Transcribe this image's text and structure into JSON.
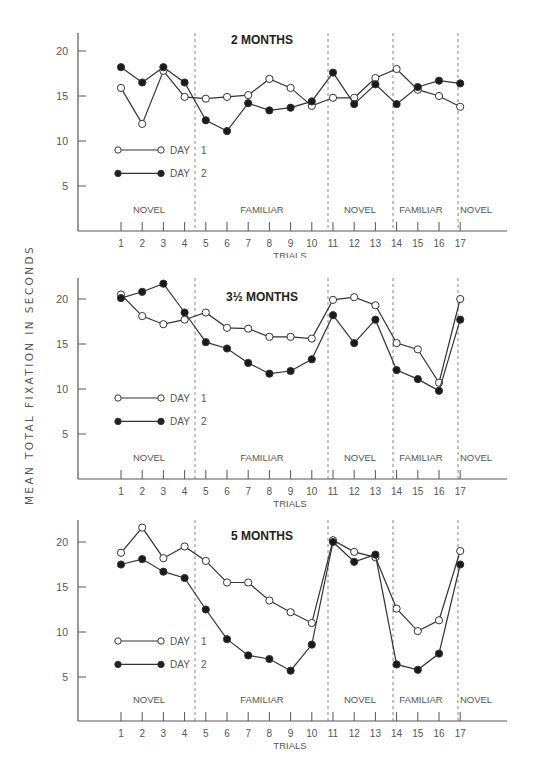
{
  "figure": {
    "y_axis_label": "MEAN TOTAL FIXATION IN SECONDS",
    "x_axis_label": "TRIALS",
    "legend": [
      {
        "label": "DAY",
        "number": "1",
        "marker": "open-circle"
      },
      {
        "label": "DAY",
        "number": "2",
        "marker": "filled-circle"
      }
    ],
    "phase_labels": [
      "NOVEL",
      "FAMILIAR",
      "NOVEL",
      "FAMILIAR",
      "NOVEL"
    ],
    "y_ticks": [
      5,
      10,
      15,
      20
    ],
    "x_ticks": [
      1,
      2,
      3,
      4,
      5,
      6,
      7,
      8,
      9,
      10,
      11,
      12,
      13,
      14,
      15,
      16,
      17
    ],
    "colors": {
      "line": "#333333",
      "axis": "#555555",
      "text": "#555555",
      "title": "#222222"
    }
  },
  "chart_data": [
    {
      "type": "line",
      "title": "2 MONTHS",
      "xlabel": "TRIALS",
      "ylabel": "MEAN TOTAL FIXATION IN SECONDS",
      "x": [
        1,
        2,
        3,
        4,
        5,
        6,
        7,
        8,
        9,
        10,
        11,
        12,
        13,
        14,
        15,
        16,
        17
      ],
      "ylim": [
        0,
        22
      ],
      "phases": [
        {
          "label": "NOVEL",
          "trials": [
            1,
            4
          ]
        },
        {
          "label": "FAMILIAR",
          "trials": [
            5,
            10
          ]
        },
        {
          "label": "NOVEL",
          "trials": [
            11,
            13
          ]
        },
        {
          "label": "FAMILIAR",
          "trials": [
            14,
            16
          ]
        },
        {
          "label": "NOVEL",
          "trials": [
            17,
            17
          ]
        }
      ],
      "series": [
        {
          "name": "DAY 1",
          "marker": "open",
          "values": [
            15.9,
            11.9,
            17.8,
            14.9,
            14.7,
            14.9,
            15.1,
            16.9,
            15.9,
            13.9,
            14.8,
            14.8,
            17.0,
            18.0,
            15.7,
            15.0,
            13.8
          ]
        },
        {
          "name": "DAY 2",
          "marker": "filled",
          "values": [
            18.2,
            16.5,
            18.2,
            16.5,
            12.3,
            11.1,
            14.2,
            13.4,
            13.7,
            14.4,
            17.6,
            14.1,
            16.3,
            14.1,
            16.0,
            16.7,
            16.4
          ]
        }
      ],
      "legend_position": "inside-left"
    },
    {
      "type": "line",
      "title": "3½ MONTHS",
      "xlabel": "TRIALS",
      "ylabel": "MEAN TOTAL FIXATION IN SECONDS",
      "x": [
        1,
        2,
        3,
        4,
        5,
        6,
        7,
        8,
        9,
        10,
        11,
        12,
        13,
        14,
        15,
        16,
        17
      ],
      "ylim": [
        0,
        22
      ],
      "phases": [
        {
          "label": "NOVEL",
          "trials": [
            1,
            4
          ]
        },
        {
          "label": "FAMILIAR",
          "trials": [
            5,
            10
          ]
        },
        {
          "label": "NOVEL",
          "trials": [
            11,
            13
          ]
        },
        {
          "label": "FAMILIAR",
          "trials": [
            14,
            16
          ]
        },
        {
          "label": "NOVEL",
          "trials": [
            17,
            17
          ]
        }
      ],
      "series": [
        {
          "name": "DAY 1",
          "marker": "open",
          "values": [
            20.5,
            18.1,
            17.2,
            17.7,
            18.5,
            16.8,
            16.7,
            15.8,
            15.8,
            15.6,
            19.9,
            20.2,
            19.3,
            15.1,
            14.4,
            10.7,
            20.0
          ]
        },
        {
          "name": "DAY 2",
          "marker": "filled",
          "values": [
            20.1,
            20.8,
            21.7,
            18.5,
            15.2,
            14.5,
            12.9,
            11.7,
            12.0,
            13.3,
            18.2,
            15.1,
            17.7,
            12.1,
            11.1,
            9.8,
            17.7
          ]
        }
      ],
      "legend_position": "inside-left"
    },
    {
      "type": "line",
      "title": "5 MONTHS",
      "xlabel": "TRIALS",
      "ylabel": "MEAN TOTAL FIXATION IN SECONDS",
      "x": [
        1,
        2,
        3,
        4,
        5,
        6,
        7,
        8,
        9,
        10,
        11,
        12,
        13,
        14,
        15,
        16,
        17
      ],
      "ylim": [
        0,
        22
      ],
      "phases": [
        {
          "label": "NOVEL",
          "trials": [
            1,
            4
          ]
        },
        {
          "label": "FAMILIAR",
          "trials": [
            5,
            10
          ]
        },
        {
          "label": "NOVEL",
          "trials": [
            11,
            13
          ]
        },
        {
          "label": "FAMILIAR",
          "trials": [
            14,
            16
          ]
        },
        {
          "label": "NOVEL",
          "trials": [
            17,
            17
          ]
        }
      ],
      "series": [
        {
          "name": "DAY 1",
          "marker": "open",
          "values": [
            18.8,
            21.6,
            18.2,
            19.5,
            17.9,
            15.5,
            15.5,
            13.5,
            12.2,
            11.0,
            20.2,
            18.9,
            18.3,
            12.6,
            10.1,
            11.3,
            19.0
          ]
        },
        {
          "name": "DAY 2",
          "marker": "filled",
          "values": [
            17.5,
            18.1,
            16.7,
            16.0,
            12.5,
            9.2,
            7.4,
            7.0,
            5.7,
            8.6,
            20.0,
            17.8,
            18.6,
            6.4,
            5.8,
            7.6,
            17.5
          ]
        }
      ],
      "legend_position": "inside-left"
    }
  ]
}
